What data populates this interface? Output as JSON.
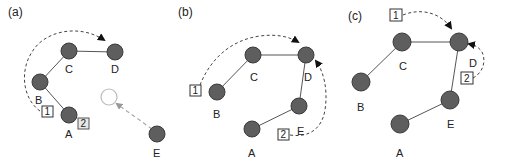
{
  "figure": {
    "colors": {
      "node_fill": "#5e5e5e",
      "node_stroke": "#3a3a3a",
      "edge": "#555555",
      "ghost_node_stroke": "#bbbbbb",
      "ghost_arrow": "#aaaaaa",
      "dashed_arrow": "#444444"
    },
    "panels": [
      {
        "id": "a",
        "label": "(a)",
        "label_pos": [
          8,
          14
        ],
        "nodes": [
          {
            "id": "A",
            "label": "A",
            "x": 69,
            "y": 115,
            "label_pos": [
              66,
              137
            ]
          },
          {
            "id": "B",
            "label": "B",
            "x": 40,
            "y": 82,
            "label_pos": [
              36,
              103
            ]
          },
          {
            "id": "C",
            "label": "C",
            "x": 69,
            "y": 51,
            "label_pos": [
              66,
              72
            ]
          },
          {
            "id": "D",
            "label": "D",
            "x": 115,
            "y": 52,
            "label_pos": [
              112,
              72
            ]
          },
          {
            "id": "E",
            "label": "E",
            "x": 157,
            "y": 134,
            "label_pos": [
              154,
              156
            ]
          }
        ],
        "ghost_nodes": [
          {
            "x": 109,
            "y": 97
          }
        ],
        "edges": [
          [
            "B",
            "C"
          ],
          [
            "C",
            "D"
          ],
          [
            "B",
            "A"
          ]
        ],
        "boxes": [
          {
            "label": "1",
            "x": 47,
            "y": 112,
            "shaded": false
          },
          {
            "label": "2",
            "x": 83,
            "y": 124,
            "shaded": true
          }
        ]
      },
      {
        "id": "b",
        "label": "(b)",
        "label_pos": [
          178,
          14
        ],
        "nodes": [
          {
            "id": "A",
            "label": "A",
            "x": 252,
            "y": 129,
            "label_pos": [
              248,
              156
            ]
          },
          {
            "id": "B",
            "label": "B",
            "x": 217,
            "y": 92,
            "label_pos": [
              213,
              117
            ]
          },
          {
            "id": "C",
            "label": "C",
            "x": 253,
            "y": 55,
            "label_pos": [
              250,
              80
            ]
          },
          {
            "id": "D",
            "label": "D",
            "x": 306,
            "y": 55,
            "label_pos": [
              304,
              80
            ]
          },
          {
            "id": "E",
            "label": "E",
            "x": 299,
            "y": 106,
            "label_pos": [
              296,
              134
            ]
          }
        ],
        "ghost_nodes": [],
        "edges": [
          [
            "B",
            "C"
          ],
          [
            "C",
            "D"
          ],
          [
            "D",
            "E"
          ],
          [
            "E",
            "A"
          ]
        ],
        "boxes": [
          {
            "label": "1",
            "x": 196,
            "y": 91,
            "shaded": false
          },
          {
            "label": "2",
            "x": 283,
            "y": 134,
            "shaded": false
          }
        ]
      },
      {
        "id": "c",
        "label": "(c)",
        "label_pos": [
          348,
          19
        ],
        "nodes": [
          {
            "id": "A",
            "label": "A",
            "x": 400,
            "y": 124,
            "label_pos": [
              397,
              156
            ]
          },
          {
            "id": "B",
            "label": "B",
            "x": 361,
            "y": 82,
            "label_pos": [
              357,
              110
            ]
          },
          {
            "id": "C",
            "label": "C",
            "x": 402,
            "y": 42,
            "label_pos": [
              399,
              69
            ]
          },
          {
            "id": "D",
            "label": "D",
            "x": 459,
            "y": 42,
            "label_pos": [
              457,
              66
            ]
          },
          {
            "id": "E",
            "label": "E",
            "x": 450,
            "y": 100,
            "label_pos": [
              447,
              127
            ]
          }
        ],
        "ghost_nodes": [],
        "edges": [
          [
            "B",
            "C"
          ],
          [
            "C",
            "D"
          ],
          [
            "D",
            "E"
          ],
          [
            "E",
            "A"
          ]
        ],
        "boxes": [
          {
            "label": "1",
            "x": 396,
            "y": 16,
            "shaded": false
          },
          {
            "label": "2",
            "x": 466,
            "y": 77,
            "shaded": false
          }
        ]
      }
    ]
  }
}
